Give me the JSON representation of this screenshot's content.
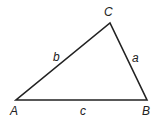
{
  "diagram": {
    "type": "triangle",
    "vertices": [
      {
        "id": "A",
        "label": "A",
        "x": 16,
        "y": 100,
        "lx": 10,
        "ly": 115
      },
      {
        "id": "B",
        "label": "B",
        "x": 147,
        "y": 100,
        "lx": 142,
        "ly": 115
      },
      {
        "id": "C",
        "label": "C",
        "x": 110,
        "y": 23,
        "lx": 104,
        "ly": 16
      }
    ],
    "sides": [
      {
        "id": "a",
        "label": "a",
        "from": "B",
        "to": "C",
        "lx": 132,
        "ly": 62
      },
      {
        "id": "b",
        "label": "b",
        "from": "A",
        "to": "C",
        "lx": 53,
        "ly": 61
      },
      {
        "id": "c",
        "label": "c",
        "from": "A",
        "to": "B",
        "lx": 80,
        "ly": 115
      }
    ],
    "stroke_color": "#222222"
  }
}
